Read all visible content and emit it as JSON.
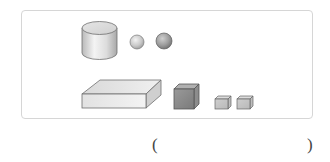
{
  "figure": {
    "border_color": "#d6d6d6",
    "shapes": [
      {
        "type": "cylinder",
        "row": 1,
        "position": 1
      },
      {
        "type": "sphere",
        "size": "small",
        "row": 1,
        "position": 2
      },
      {
        "type": "sphere",
        "size": "medium",
        "row": 1,
        "position": 3
      },
      {
        "type": "rectangular-prism",
        "size": "large-flat",
        "row": 2,
        "position": 1
      },
      {
        "type": "cube",
        "size": "medium",
        "shade": "dark",
        "row": 2,
        "position": 2
      },
      {
        "type": "cube",
        "size": "small",
        "row": 2,
        "position": 3
      },
      {
        "type": "cube",
        "size": "small",
        "row": 2,
        "position": 4
      }
    ]
  },
  "answer": {
    "open_paren": "(",
    "close_paren": ")",
    "value": ""
  }
}
